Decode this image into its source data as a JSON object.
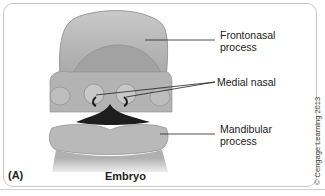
{
  "figure": {
    "panel_label": "(A)",
    "caption": "Embryo",
    "copyright": "© Cengage Learning 2013",
    "labels": [
      {
        "line1": "Frontonasal",
        "line2": "process"
      },
      {
        "line1": "Medial nasal",
        "line2": ""
      },
      {
        "line1": "Mandibular",
        "line2": "process"
      }
    ],
    "colors": {
      "tissue": "#a9a9a9",
      "tissue_light": "#c4c4c4",
      "tissue_dark": "#8e8e8e",
      "mouth": "#1e1e1e",
      "leader_line": "#222222"
    }
  }
}
